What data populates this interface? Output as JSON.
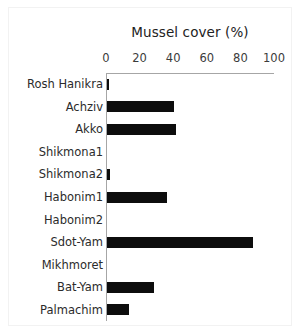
{
  "chart_data": {
    "type": "bar",
    "orientation": "horizontal",
    "title": "Mussel cover (%)",
    "xlabel": "",
    "ylabel": "",
    "xlim": [
      0,
      100
    ],
    "xticks": [
      0,
      20,
      40,
      60,
      80,
      100
    ],
    "xtick_labels": [
      "0",
      "20",
      "40",
      "60",
      "80",
      "100"
    ],
    "grid": false,
    "legend": false,
    "axis_position": "top",
    "bar_color": "#0d0d0d",
    "categories": [
      "Rosh Hanikra",
      "Achziv",
      "Akko",
      "Shikmona1",
      "Shikmona2",
      "Habonim1",
      "Habonim2",
      "Sdot-Yam",
      "Mikhmoret",
      "Bat-Yam",
      "Palmachim"
    ],
    "values": [
      1,
      40,
      41,
      0,
      2,
      36,
      0,
      87,
      0,
      28,
      13
    ]
  }
}
